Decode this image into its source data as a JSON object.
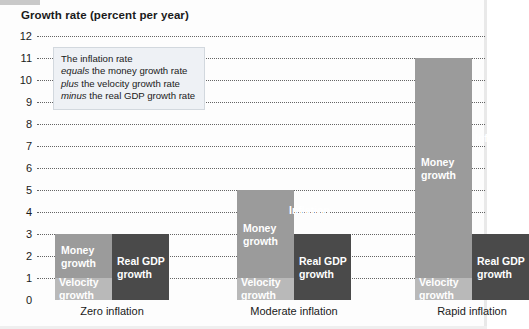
{
  "figure": {
    "title": "Growth rate (percent per year)"
  },
  "note": {
    "line1_plain": "The inflation rate",
    "line2_italic": "equals",
    "line2_plain": " the money growth rate",
    "line3_italic": "plus",
    "line3_plain": " the velocity growth rate",
    "line4_italic": "minus",
    "line4_plain": " the real GDP growth rate"
  },
  "labels": {
    "money_growth": "Money\ngrowth",
    "velocity_growth": "Velocity\ngrowth",
    "real_gdp_growth": "Real GDP\ngrowth",
    "inflation": "Inflation"
  },
  "colors": {
    "light_bar": "#9b9b9b",
    "velocity_bar": "#b9b9b9",
    "dark_bar": "#4a4a4a",
    "gridline": "#4a4a4a",
    "note_bg": "#eef1f5"
  },
  "chart_data": {
    "type": "bar",
    "title": "Growth rate (percent per year)",
    "xlabel": "",
    "ylabel": "Growth rate (percent per year)",
    "ylim": [
      0,
      12
    ],
    "yticks": [
      0,
      1,
      2,
      3,
      4,
      5,
      6,
      7,
      8,
      9,
      10,
      11,
      12
    ],
    "grid": true,
    "legend": "none",
    "categories": [
      "Zero inflation",
      "Moderate inflation",
      "Rapid inflation"
    ],
    "series": [
      {
        "name": "Money growth",
        "values": [
          2,
          4,
          10
        ]
      },
      {
        "name": "Velocity growth",
        "values": [
          1,
          1,
          1
        ]
      },
      {
        "name": "Real GDP growth",
        "values": [
          3,
          3,
          3
        ]
      },
      {
        "name": "Inflation",
        "values": [
          0,
          2,
          8
        ]
      }
    ]
  },
  "groups": [
    {
      "category": "Zero inflation",
      "left_total": 3,
      "velocity": 1,
      "right_total": 3,
      "show_inflation_label": false
    },
    {
      "category": "Moderate inflation",
      "left_total": 5,
      "velocity": 1,
      "right_total": 3,
      "show_inflation_label": true
    },
    {
      "category": "Rapid inflation",
      "left_total": 11,
      "velocity": 1,
      "right_total": 3,
      "show_inflation_label": true
    }
  ]
}
